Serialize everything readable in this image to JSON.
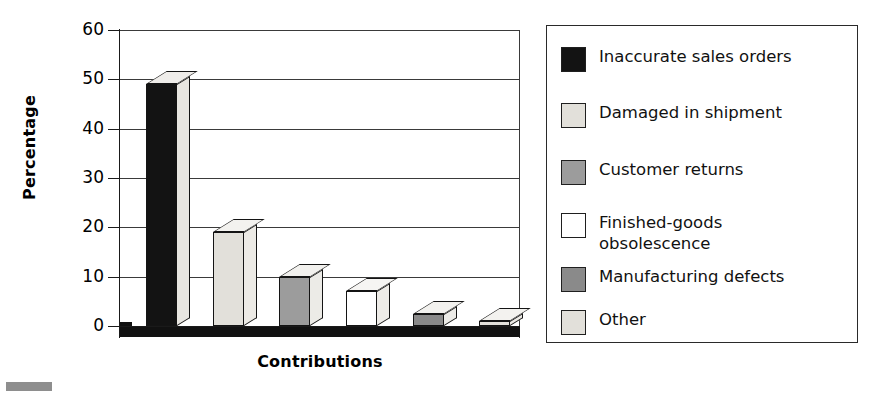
{
  "chart_data": {
    "type": "bar",
    "title": "",
    "xlabel": "Contributions",
    "ylabel": "Percentage",
    "ylim": [
      0,
      60
    ],
    "yticks": [
      0,
      10,
      20,
      30,
      40,
      50,
      60
    ],
    "ytick_labels": [
      "0",
      "10",
      "20",
      "30",
      "40",
      "50",
      "60"
    ],
    "grid": "horizontal",
    "legend_position": "right",
    "style": "3d-column",
    "categories": [
      "Inaccurate sales orders",
      "Damaged in shipment",
      "Customer returns",
      "Finished-goods obsolescence",
      "Manufacturing defects",
      "Other"
    ],
    "values": [
      49,
      19,
      10,
      7,
      2.5,
      1
    ],
    "bar_colors": [
      "#131313",
      "#e2e0da",
      "#9c9c9c",
      "#ffffff",
      "#8a8a8a",
      "#e2e0da"
    ]
  },
  "axes": {
    "ylabel": "Percentage",
    "xlabel": "Contributions",
    "ytick_labels": [
      "60",
      "50",
      "40",
      "30",
      "20",
      "10",
      "0"
    ]
  },
  "legend": {
    "items": [
      {
        "label": "Inaccurate sales orders",
        "swatch_class": "fill-black",
        "swatch_name": "legend-swatch-black"
      },
      {
        "label": "Damaged in shipment",
        "swatch_class": "fill-ltgray",
        "swatch_name": "legend-swatch-light-gray"
      },
      {
        "label": "Customer returns",
        "swatch_class": "fill-mdgray",
        "swatch_name": "legend-swatch-medium-gray"
      },
      {
        "label": "Finished-goods\nobsolescence",
        "swatch_class": "fill-white",
        "swatch_name": "legend-swatch-white"
      },
      {
        "label": "Manufacturing defects",
        "swatch_class": "fill-dkgray",
        "swatch_name": "legend-swatch-dark-gray"
      },
      {
        "label": "Other",
        "swatch_class": "fill-ltgray",
        "swatch_name": "legend-swatch-light-gray-2"
      }
    ]
  },
  "colors": {
    "axis": "#1a1a1a",
    "grid": "#3a3a3a",
    "background": "#ffffff",
    "floor": "#111111"
  }
}
